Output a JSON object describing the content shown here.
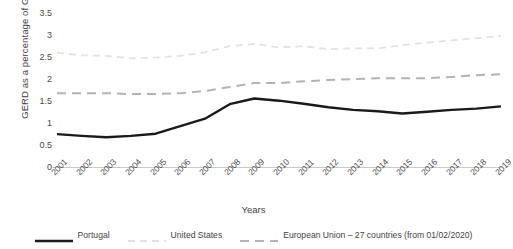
{
  "chart_data": {
    "type": "line",
    "title": "",
    "xlabel": "Years",
    "ylabel": "GERD as a percentage of GDP",
    "ylim": [
      0,
      3.5
    ],
    "ytick_step": 0.5,
    "yticks": [
      "0",
      "0.5",
      "1",
      "1.5",
      "2",
      "2.5",
      "3",
      "3.5"
    ],
    "grid": false,
    "legend_position": "bottom",
    "categories": [
      "2001",
      "2002",
      "2003",
      "2004",
      "2005",
      "2006",
      "2007",
      "2008",
      "2009",
      "2010",
      "2011",
      "2012",
      "2013",
      "2014",
      "2015",
      "2016",
      "2017",
      "2018",
      "2019"
    ],
    "series": [
      {
        "name": "Portugal",
        "color": "#1a1a1a",
        "style": "solid",
        "width": 2.4,
        "values": [
          0.77,
          0.73,
          0.7,
          0.73,
          0.78,
          0.95,
          1.12,
          1.45,
          1.58,
          1.53,
          1.46,
          1.38,
          1.32,
          1.29,
          1.24,
          1.28,
          1.32,
          1.35,
          1.4
        ]
      },
      {
        "name": "United States",
        "color": "#e2e2e2",
        "style": "dashed",
        "width": 1.8,
        "values": [
          2.62,
          2.56,
          2.55,
          2.49,
          2.51,
          2.55,
          2.63,
          2.77,
          2.82,
          2.74,
          2.77,
          2.7,
          2.72,
          2.72,
          2.79,
          2.85,
          2.9,
          2.95,
          3.0
        ]
      },
      {
        "name": "European Union – 27 countries (from 01/02/2020)",
        "color": "#b3b3b3",
        "style": "dashed",
        "width": 2.0,
        "values": [
          1.7,
          1.7,
          1.7,
          1.68,
          1.68,
          1.7,
          1.75,
          1.84,
          1.93,
          1.93,
          1.97,
          2.0,
          2.02,
          2.04,
          2.04,
          2.04,
          2.07,
          2.11,
          2.13
        ]
      }
    ]
  },
  "axes": {
    "y_title": "GERD as a percentage of GDP",
    "x_title": "Years"
  },
  "legend": {
    "items": [
      {
        "label": "Portugal"
      },
      {
        "label": "United States"
      },
      {
        "label": "European Union – 27 countries (from 01/02/2020)"
      }
    ]
  },
  "colors": {
    "portugal": "#1a1a1a",
    "united_states": "#e2e2e2",
    "european_union": "#b3b3b3",
    "axis": "#c9c9c9",
    "text": "#3f3f3f",
    "background": "#ffffff"
  }
}
